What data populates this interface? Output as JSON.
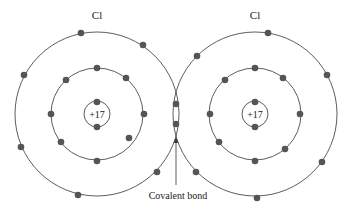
{
  "atoms": [
    {
      "label": "Cl",
      "charge": "+17",
      "cx": 97,
      "cy": 114,
      "nucleus_e": [
        [
          97,
          102
        ],
        [
          97,
          127
        ]
      ],
      "shell2": [
        [
          97,
          68
        ],
        [
          66,
          80
        ],
        [
          126,
          78
        ],
        [
          51,
          114
        ],
        [
          144,
          114
        ],
        [
          61,
          142
        ],
        [
          129,
          138
        ],
        [
          97,
          161
        ]
      ],
      "shell3": [
        [
          81,
          33
        ],
        [
          143,
          45
        ],
        [
          24,
          75
        ],
        [
          21,
          147
        ],
        [
          157,
          172
        ],
        [
          78,
          195
        ]
      ]
    },
    {
      "label": "Cl",
      "charge": "+17",
      "cx": 255,
      "cy": 114,
      "nucleus_e": [
        [
          255,
          102
        ],
        [
          255,
          127
        ]
      ],
      "shell2": [
        [
          255,
          68
        ],
        [
          225,
          80
        ],
        [
          283,
          78
        ],
        [
          210,
          114
        ],
        [
          300,
          114
        ],
        [
          219,
          142
        ],
        [
          285,
          149
        ],
        [
          255,
          161
        ]
      ],
      "shell3": [
        [
          268,
          33
        ],
        [
          197,
          56
        ],
        [
          327,
          75
        ],
        [
          322,
          162
        ],
        [
          196,
          172
        ],
        [
          257,
          198
        ]
      ]
    }
  ],
  "bond_electrons": [
    [
      176,
      104
    ],
    [
      176,
      124
    ]
  ],
  "bond_label": "Covalent bond",
  "colors": {
    "line": "#333333",
    "electron": "#555555"
  }
}
